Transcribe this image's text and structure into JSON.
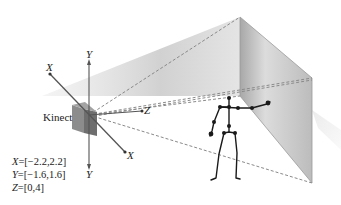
{
  "diagram": {
    "device_label": "Kinect",
    "axes": {
      "x_top": "X",
      "x_bottom": "X",
      "y_top": "Y",
      "y_bottom": "Y",
      "z": "Z"
    },
    "ranges": [
      {
        "axis": "X",
        "value": "=[−2.2,2.2]"
      },
      {
        "axis": "Y",
        "value": "=[−1.6,1.6]"
      },
      {
        "axis": "Z",
        "value": "=[0,4]"
      }
    ],
    "colors": {
      "axis": "#555555",
      "dashed": "#8a8a8a",
      "panel": "#bdbdbd",
      "wedge": "#c8c8c8",
      "skeleton": "#1a1a1a",
      "device": "#7a7a7a"
    }
  }
}
